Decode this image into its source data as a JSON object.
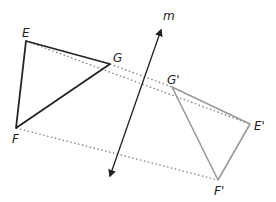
{
  "diagram": {
    "type": "reflection",
    "line": {
      "label": "m",
      "color": "#222222"
    },
    "preimage": {
      "color": "#222222",
      "vertices": [
        {
          "label": "E",
          "x": 26,
          "y": 41
        },
        {
          "label": "G",
          "x": 110,
          "y": 64
        },
        {
          "label": "F",
          "x": 16,
          "y": 128
        }
      ]
    },
    "image": {
      "color": "#9a9a9a",
      "vertices": [
        {
          "label": "G'",
          "x": 172,
          "y": 87
        },
        {
          "label": "E'",
          "x": 250,
          "y": 124
        },
        {
          "label": "F'",
          "x": 218,
          "y": 180
        }
      ]
    },
    "connector_color": "#777777"
  }
}
